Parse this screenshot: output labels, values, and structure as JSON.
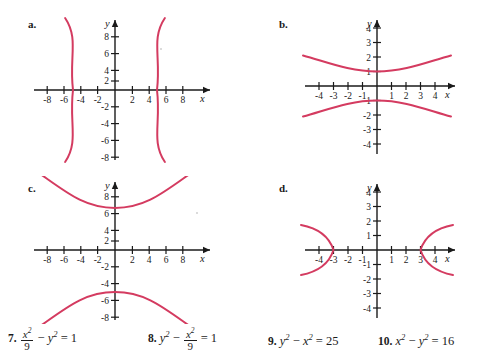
{
  "document": {
    "kind": "textbook-exercise-figure",
    "description": "Four hyperbola graphs labeled a through d with four matching equations numbered 7 through 10"
  },
  "panels": [
    {
      "id": "a",
      "label": "a.",
      "axis": {
        "x_label": "x",
        "y_label": "y",
        "x_min": -9.6,
        "x_max": 9.6,
        "y_min": -9.6,
        "y_max": 9.6,
        "x_ticks": [
          -8,
          -6,
          -4,
          -2,
          2,
          4,
          6,
          8
        ],
        "y_ticks": [
          -8,
          -6,
          -4,
          -2,
          2,
          4,
          6,
          8
        ],
        "x_tick_labels": [
          "-8",
          "-6",
          "-4",
          "-2",
          "2",
          "4",
          "6",
          "8"
        ],
        "y_tick_labels": [
          "-8",
          "-6",
          "-4",
          "-2",
          "2",
          "4",
          "6",
          "8"
        ]
      },
      "curve": {
        "type": "hyperbola",
        "orientation": "horizontal",
        "a": 5,
        "b": 5,
        "vertices": [
          [
            -5,
            0
          ],
          [
            5,
            0
          ]
        ],
        "equation": "x^2 - y^2 = 25",
        "color": "#d43b60"
      }
    },
    {
      "id": "b",
      "label": "b.",
      "axis": {
        "x_label": "x",
        "y_label": "y",
        "x_min": -5.0,
        "x_max": 5.0,
        "y_min": -4.9,
        "y_max": 4.9,
        "x_ticks": [
          -4,
          -3,
          -2,
          -1,
          1,
          2,
          3,
          4
        ],
        "y_ticks": [
          -4,
          -3,
          -2,
          -1,
          1,
          2,
          3,
          4
        ],
        "x_tick_labels": [
          "-4",
          "-3",
          "-2",
          "-1",
          "1",
          "2",
          "3",
          "4"
        ],
        "y_tick_labels": [
          "-4",
          "-3",
          "-2",
          "-1",
          "1",
          "2",
          "3",
          "4"
        ]
      },
      "curve": {
        "type": "hyperbola",
        "orientation": "vertical",
        "a": 1,
        "b": 3,
        "vertices": [
          [
            0,
            -1
          ],
          [
            0,
            1
          ]
        ],
        "equation": "y^2 - x^2/9 = 1",
        "color": "#d43b60"
      }
    },
    {
      "id": "c",
      "label": "c.",
      "axis": {
        "x_label": "x",
        "y_label": "y",
        "x_min": -9.6,
        "x_max": 9.6,
        "y_min": -9.6,
        "y_max": 9.6,
        "x_ticks": [
          -8,
          -6,
          -4,
          -2,
          2,
          4,
          6,
          8
        ],
        "y_ticks": [
          -8,
          -6,
          -4,
          -2,
          2,
          4,
          6,
          8
        ],
        "x_tick_labels": [
          "-8",
          "-6",
          "-4",
          "-2",
          "2",
          "4",
          "6",
          "8"
        ],
        "y_tick_labels": [
          "-8",
          "-6",
          "-4",
          "-2",
          "2",
          "4",
          "6",
          "8"
        ]
      },
      "curve": {
        "type": "hyperbola",
        "orientation": "vertical",
        "a": 5,
        "b": 5,
        "vertices": [
          [
            0,
            -5
          ],
          [
            0,
            5
          ]
        ],
        "equation": "y^2 - x^2 = 25",
        "color": "#d43b60"
      }
    },
    {
      "id": "d",
      "label": "d.",
      "axis": {
        "x_label": "x",
        "y_label": "y",
        "x_min": -5.0,
        "x_max": 5.0,
        "y_min": -4.9,
        "y_max": 4.9,
        "x_ticks": [
          -4,
          -3,
          -2,
          -1,
          1,
          2,
          3,
          4
        ],
        "y_ticks": [
          -4,
          -3,
          -2,
          -1,
          1,
          2,
          3,
          4
        ],
        "x_tick_labels": [
          "-4",
          "-3",
          "-2",
          "-1",
          "1",
          "2",
          "3",
          "4"
        ],
        "y_tick_labels": [
          "-4",
          "-3",
          "-2",
          "-1",
          "1",
          "2",
          "3",
          "4"
        ]
      },
      "curve": {
        "type": "hyperbola",
        "orientation": "horizontal",
        "a": 3,
        "b": 1,
        "vertices": [
          [
            -3,
            0
          ],
          [
            3,
            0
          ]
        ],
        "equation": "x^2/9 - y^2 = 1",
        "color": "#d43b60"
      }
    }
  ],
  "equations": [
    {
      "number": "7.",
      "lhs_first_numerator": "x",
      "lhs_first_denominator": "9",
      "operator": "−",
      "second_term": "y",
      "equals": "= 1",
      "plain": "x^2/9 - y^2 = 1"
    },
    {
      "number": "8.",
      "first_term": "y",
      "operator": "−",
      "lhs_second_numerator": "x",
      "lhs_second_denominator": "9",
      "equals": "= 1",
      "plain": "y^2 - x^2/9 = 1"
    },
    {
      "number": "9.",
      "plain": "y^2 - x^2 = 25",
      "first_term": "y",
      "operator": "−",
      "second_term": "x",
      "equals": "= 25"
    },
    {
      "number": "10.",
      "plain": "x^2 - y^2 = 16",
      "first_term": "x",
      "operator": "−",
      "second_term": "y",
      "equals": "= 16"
    }
  ],
  "colors": {
    "curve": "#d43b60",
    "axis": "#1a1a1a",
    "text": "#1c1c1c",
    "background": "#ffffff",
    "stray_mark": "#b9b9b9"
  },
  "annotations": {
    "stray_pencil_mark": "faint handwritten squiggle left of panel d"
  }
}
